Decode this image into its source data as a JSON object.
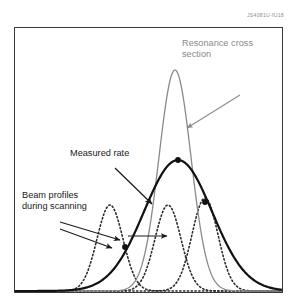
{
  "figure": {
    "figure_id": "JS4081U-fU18",
    "frame": {
      "x": 14,
      "y": 27,
      "width": 269,
      "height": 266,
      "border_color": "#3a3a3a"
    }
  },
  "labels": {
    "resonance": "Resonance cross\nsection",
    "measured": "Measured rate",
    "beam": "Beam profiles\nduring scanning"
  },
  "colors": {
    "resonance_curve": "#8a8a8a",
    "measured_curve": "#111111",
    "beam_profile": "#2b2b2b",
    "label_gray": "#8a8a8a",
    "label_dark": "#1a1a1a",
    "frame": "#3a3a3a",
    "background": "#ffffff"
  },
  "chart_data": {
    "type": "line",
    "title": "",
    "xlabel": "",
    "ylabel": "",
    "grid": false,
    "axis_ticks": false,
    "legend": "annotations",
    "xlim": [
      0,
      269
    ],
    "ylim": [
      0,
      266
    ],
    "series": [
      {
        "name": "Resonance cross section",
        "style": "solid",
        "color": "#8a8a8a",
        "width": 1.3,
        "peak_x": 175,
        "peak_y": 70,
        "sigma": 16,
        "amplitude": 1.0,
        "annotation": "Resonance cross\nsection"
      },
      {
        "name": "Measured rate",
        "style": "solid",
        "color": "#111111",
        "width": 2.2,
        "peak_x": 178,
        "peak_y": 160,
        "sigma": 34,
        "amplitude": 0.62,
        "annotation": "Measured rate",
        "markers": [
          {
            "x": 125,
            "y": 247
          },
          {
            "x": 178,
            "y": 160
          },
          {
            "x": 205,
            "y": 202
          }
        ]
      },
      {
        "name": "Beam profile 1",
        "style": "dotted",
        "color": "#2b2b2b",
        "width": 1.6,
        "peak_x": 110,
        "peak_y": 205,
        "sigma": 13,
        "amplitude": 0.33
      },
      {
        "name": "Beam profile 2",
        "style": "dotted",
        "color": "#2b2b2b",
        "width": 1.6,
        "peak_x": 168,
        "peak_y": 205,
        "sigma": 13,
        "amplitude": 0.33
      },
      {
        "name": "Beam profile 3",
        "style": "dotted",
        "color": "#2b2b2b",
        "width": 1.6,
        "peak_x": 205,
        "peak_y": 198,
        "sigma": 13,
        "amplitude": 0.36
      }
    ],
    "annotations": [
      {
        "name": "resonance-arrow",
        "from": [
          240,
          95
        ],
        "to": [
          187,
          128
        ],
        "color": "#8a8a8a"
      },
      {
        "name": "measured-arrow",
        "from": [
          115,
          168
        ],
        "to": [
          152,
          204
        ],
        "color": "#1a1a1a"
      },
      {
        "name": "beam-arrow-upper",
        "from": [
          60,
          222
        ],
        "to": [
          120,
          240
        ],
        "color": "#1a1a1a"
      },
      {
        "name": "beam-arrow-lower",
        "from": [
          60,
          229
        ],
        "to": [
          112,
          248
        ],
        "color": "#1a1a1a"
      },
      {
        "name": "scan-direction-arrow",
        "from": [
          128,
          236
        ],
        "to": [
          167,
          236
        ],
        "color": "#1a1a1a"
      }
    ]
  }
}
